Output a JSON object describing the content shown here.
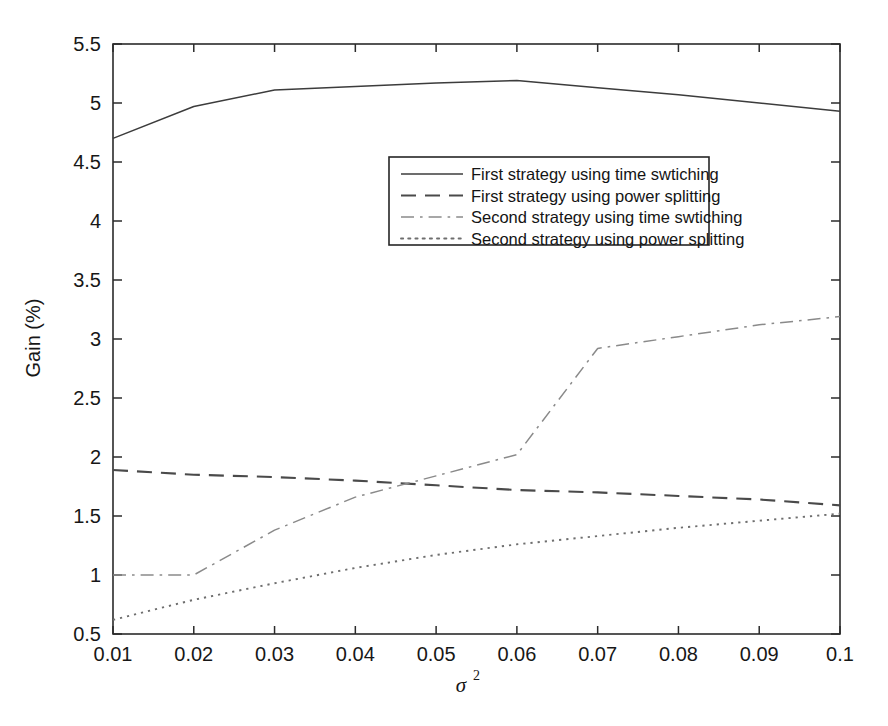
{
  "figure": {
    "background_color": "#ffffff",
    "axis_color": "#2b2b2b",
    "text_color": "#171717"
  },
  "axes": {
    "ylabel": "Gain (%)",
    "xlabel_symbol": "σ",
    "xlabel_exponent": "2",
    "x_ticks": [
      "0.01",
      "0.02",
      "0.03",
      "0.04",
      "0.05",
      "0.06",
      "0.07",
      "0.08",
      "0.09",
      "0.1"
    ],
    "y_ticks": [
      "0.5",
      "1",
      "1.5",
      "2",
      "2.5",
      "3",
      "3.5",
      "4",
      "4.5",
      "5",
      "5.5"
    ]
  },
  "legend": {
    "position": "upper-center",
    "entries": [
      {
        "label": "First strategy using time swtiching",
        "dash": "solid"
      },
      {
        "label": "First strategy using power splitting",
        "dash": "dashed"
      },
      {
        "label": "Second strategy using time swtiching",
        "dash": "dashdot"
      },
      {
        "label": "Second strategy using power splitting",
        "dash": "dotted"
      }
    ]
  },
  "chart_data": {
    "type": "line",
    "title": "",
    "xlabel": "σ²",
    "ylabel": "Gain (%)",
    "xlim": [
      0.01,
      0.1
    ],
    "ylim": [
      0.5,
      5.5
    ],
    "grid": false,
    "legend_position": "upper-center",
    "x": [
      0.01,
      0.02,
      0.03,
      0.04,
      0.05,
      0.06,
      0.07,
      0.08,
      0.09,
      0.1
    ],
    "series": [
      {
        "name": "First strategy using time swtiching",
        "style": "solid",
        "color": "#3c3c3c",
        "values": [
          4.7,
          4.97,
          5.11,
          5.14,
          5.17,
          5.19,
          5.13,
          5.07,
          5.0,
          4.93
        ]
      },
      {
        "name": "First strategy using power splitting",
        "style": "dashed",
        "color": "#4a4a4a",
        "values": [
          1.89,
          1.85,
          1.83,
          1.8,
          1.76,
          1.72,
          1.7,
          1.67,
          1.64,
          1.59
        ]
      },
      {
        "name": "Second strategy using time swtiching",
        "style": "dashdot",
        "color": "#8a8a8a",
        "values": [
          1.0,
          1.0,
          1.38,
          1.66,
          1.84,
          2.02,
          2.92,
          3.02,
          3.12,
          3.19
        ]
      },
      {
        "name": "Second strategy using power splitting",
        "style": "dotted",
        "color": "#6e6e6e",
        "values": [
          0.62,
          0.79,
          0.93,
          1.06,
          1.17,
          1.26,
          1.33,
          1.4,
          1.46,
          1.52
        ]
      }
    ]
  }
}
